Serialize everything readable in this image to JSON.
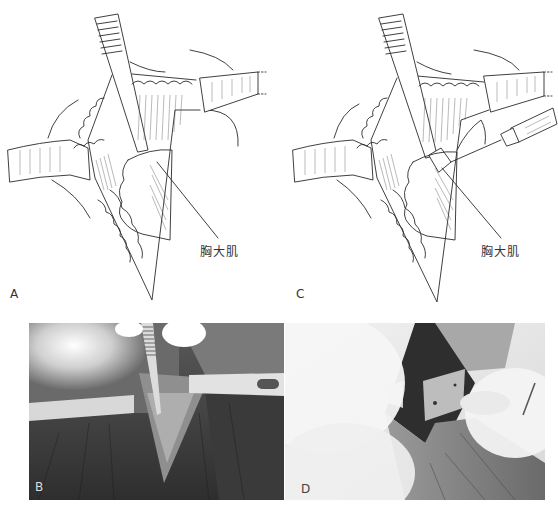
{
  "figure": {
    "panels": [
      {
        "id": "A",
        "type": "illustration",
        "label": "A",
        "callout": "胸大肌"
      },
      {
        "id": "C",
        "type": "illustration",
        "label": "C",
        "callout": "胸大肌"
      },
      {
        "id": "B",
        "type": "photograph",
        "label": "B"
      },
      {
        "id": "D",
        "type": "photograph",
        "label": "D"
      }
    ]
  },
  "colors": {
    "line": "#2a2a2a",
    "paper": "#ffffff",
    "photo_b_dark": "#3c3c3c",
    "photo_d_light": "#e6e6e6"
  }
}
